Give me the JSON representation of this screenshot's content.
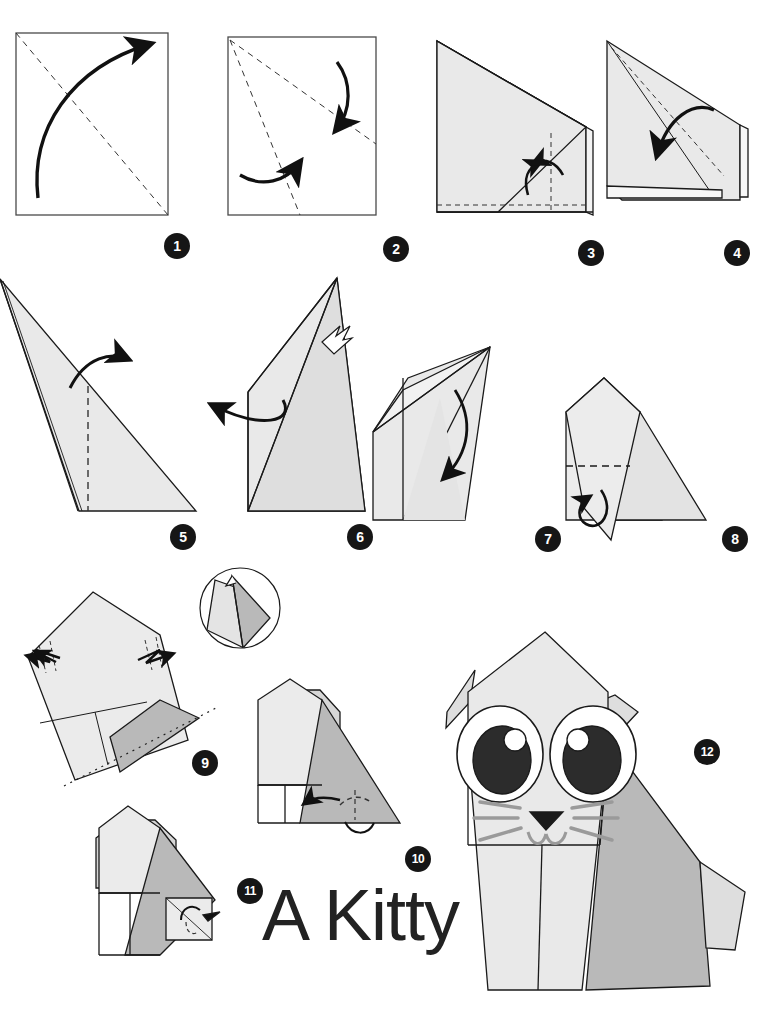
{
  "document": {
    "title": "A Kitty",
    "kind": "origami-instruction-diagram",
    "total_steps": 12,
    "background_color": "#ffffff",
    "line_color": "#1a1a1a",
    "paper_front_color": "#e9e9e9",
    "paper_back_color": "#b9b9b9",
    "paper_white_color": "#ffffff",
    "badge_color": "#161616",
    "badge_text_color": "#ffffff"
  },
  "steps": [
    {
      "number": "1",
      "label": "step-1",
      "badge_x": 164,
      "badge_y": 233,
      "caption": "Fold square in half diagonally both ways",
      "fold_lines": "two diagonal valley creases",
      "arrows": 1
    },
    {
      "number": "2",
      "label": "step-2",
      "badge_x": 383,
      "badge_y": 236,
      "caption": "Fold edges to the diagonal crease",
      "fold_lines": "three dashed creases from top-left corner",
      "arrows": 2
    },
    {
      "number": "3",
      "label": "step-3",
      "badge_x": 578,
      "badge_y": 240,
      "caption": "Fold bottom flap up and right flap in",
      "fold_lines": "horizontal and vertical dashed creases",
      "arrows": 2
    },
    {
      "number": "4",
      "label": "step-4",
      "badge_x": 724,
      "badge_y": 240,
      "caption": "Fold the upper layer down along the diagonal",
      "fold_lines": "diagonal dashed crease",
      "arrows": 1
    },
    {
      "number": "5",
      "label": "step-5",
      "badge_x": 170,
      "badge_y": 524,
      "caption": "Fold the top point over to the right",
      "fold_lines": "vertical dashed crease",
      "arrows": 1
    },
    {
      "number": "6",
      "label": "step-6",
      "badge_x": 347,
      "badge_y": 524,
      "caption": "Open out and squash fold; pull the flap to the left",
      "fold_lines": "open-out indicator",
      "arrows": 1
    },
    {
      "number": "7",
      "label": "step-7",
      "badge_x": 535,
      "badge_y": 526,
      "caption": "Fold the top flap down",
      "fold_lines": "diagonal fold",
      "arrows": 1
    },
    {
      "number": "8",
      "label": "step-8",
      "badge_x": 722,
      "badge_y": 526,
      "caption": "Fold the bottom point up behind",
      "fold_lines": "horizontal dashed crease",
      "arrows": 1
    },
    {
      "number": "9",
      "label": "step-9",
      "badge_x": 192,
      "badge_y": 750,
      "caption": "Pull out the ears on both sides; rotate the model",
      "fold_lines": "two dashed ear creases, rotation axis dotted",
      "arrows": 2
    },
    {
      "number": "10",
      "label": "step-10",
      "badge_x": 405,
      "badge_y": 846,
      "caption": "Fold the right corner in to form the tail",
      "fold_lines": "diagonal dashed crease",
      "arrows": 2
    },
    {
      "number": "11",
      "label": "step-11",
      "badge_x": 237,
      "badge_y": 878,
      "caption": "Shape the tail; press flat",
      "fold_lines": "curved crease",
      "arrows": 1
    },
    {
      "number": "12",
      "label": "step-12",
      "badge_x": 694,
      "badge_y": 739,
      "caption": "Finished kitty — draw on the face",
      "fold_lines": "",
      "arrows": 0
    }
  ],
  "detail_inset": {
    "label": "detail-circle-step-9",
    "center_x": 240,
    "center_y": 608,
    "radius": 42,
    "caption": "Close-up of the pulled-out ear"
  },
  "finished_model": {
    "label": "kitty-figure",
    "features": [
      "left-ear",
      "right-ear",
      "left-eye",
      "right-eye",
      "nose",
      "mouth",
      "whiskers",
      "body",
      "tail",
      "front-legs"
    ],
    "eye_count": 2,
    "whisker_count": 6
  }
}
